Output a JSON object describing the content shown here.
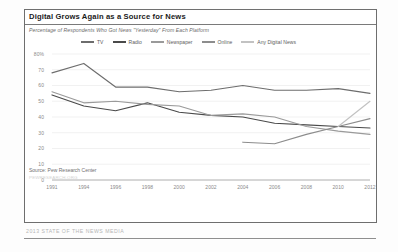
{
  "card": {
    "title": "Digital Grows Again as a Source for News",
    "subtitle": "Percentage of Respondents Who Got News \"Yesterday\" From Each Platform",
    "source": "Source: Pew Research Center",
    "source_note": "PEWRESEARCH.ORG",
    "footer": "2013 STATE OF THE NEWS MEDIA"
  },
  "colors": {
    "tv": "#6d6d6d",
    "radio": "#4a4a4a",
    "newspaper": "#9a9a9a",
    "online": "#8d8d8d",
    "any_digital_news": "#c2c2c2",
    "gridline": "#e8e8e8",
    "axis": "#9b9b9b"
  },
  "chart_data": {
    "type": "line",
    "title": "Digital Grows Again as a Source for News",
    "subtitle": "Percentage of Respondents Who Got News \"Yesterday\" From Each Platform",
    "xlabel": "",
    "ylabel": "",
    "ylim": [
      0,
      80
    ],
    "yticks": [
      "0",
      "10",
      "20",
      "30",
      "40",
      "50",
      "60",
      "70",
      "80%"
    ],
    "ytick_values": [
      0,
      10,
      20,
      30,
      40,
      50,
      60,
      70,
      80
    ],
    "grid": true,
    "legend_position": "top",
    "xticks": [
      "1991",
      "1994",
      "1996",
      "1998",
      "2000",
      "2002",
      "2004",
      "2006",
      "2008",
      "2010",
      "2012"
    ],
    "x": [
      1991,
      1994,
      1996,
      1998,
      2000,
      2002,
      2004,
      2006,
      2008,
      2010,
      2012
    ],
    "series": [
      {
        "name": "TV",
        "color": "#6d6d6d",
        "x": [
          1991,
          1994,
          1996,
          1998,
          2000,
          2002,
          2004,
          2006,
          2008,
          2010,
          2012
        ],
        "values": [
          68,
          74,
          59,
          59,
          56,
          57,
          60,
          57,
          57,
          58,
          55
        ]
      },
      {
        "name": "Radio",
        "color": "#4a4a4a",
        "x": [
          1991,
          1994,
          1996,
          1998,
          2000,
          2002,
          2004,
          2006,
          2008,
          2010,
          2012
        ],
        "values": [
          54,
          47,
          44,
          49,
          43,
          41,
          40,
          36,
          35,
          34,
          33
        ]
      },
      {
        "name": "Newspaper",
        "color": "#9a9a9a",
        "x": [
          1991,
          1994,
          1996,
          1998,
          2000,
          2002,
          2004,
          2006,
          2008,
          2010,
          2012
        ],
        "values": [
          56,
          49,
          50,
          48,
          47,
          41,
          42,
          40,
          34,
          31,
          29
        ]
      },
      {
        "name": "Online",
        "color": "#8d8d8d",
        "x": [
          2004,
          2006,
          2008,
          2010,
          2012
        ],
        "values": [
          24,
          23,
          29,
          34,
          39
        ]
      },
      {
        "name": "Any Digital News",
        "color": "#c2c2c2",
        "x": [
          2010,
          2012
        ],
        "values": [
          34,
          50
        ]
      }
    ]
  },
  "legend": [
    {
      "label": "TV",
      "color": "#6d6d6d"
    },
    {
      "label": "Radio",
      "color": "#4a4a4a"
    },
    {
      "label": "Newspaper",
      "color": "#9a9a9a"
    },
    {
      "label": "Online",
      "color": "#8d8d8d"
    },
    {
      "label": "Any Digital News",
      "color": "#c2c2c2"
    }
  ]
}
